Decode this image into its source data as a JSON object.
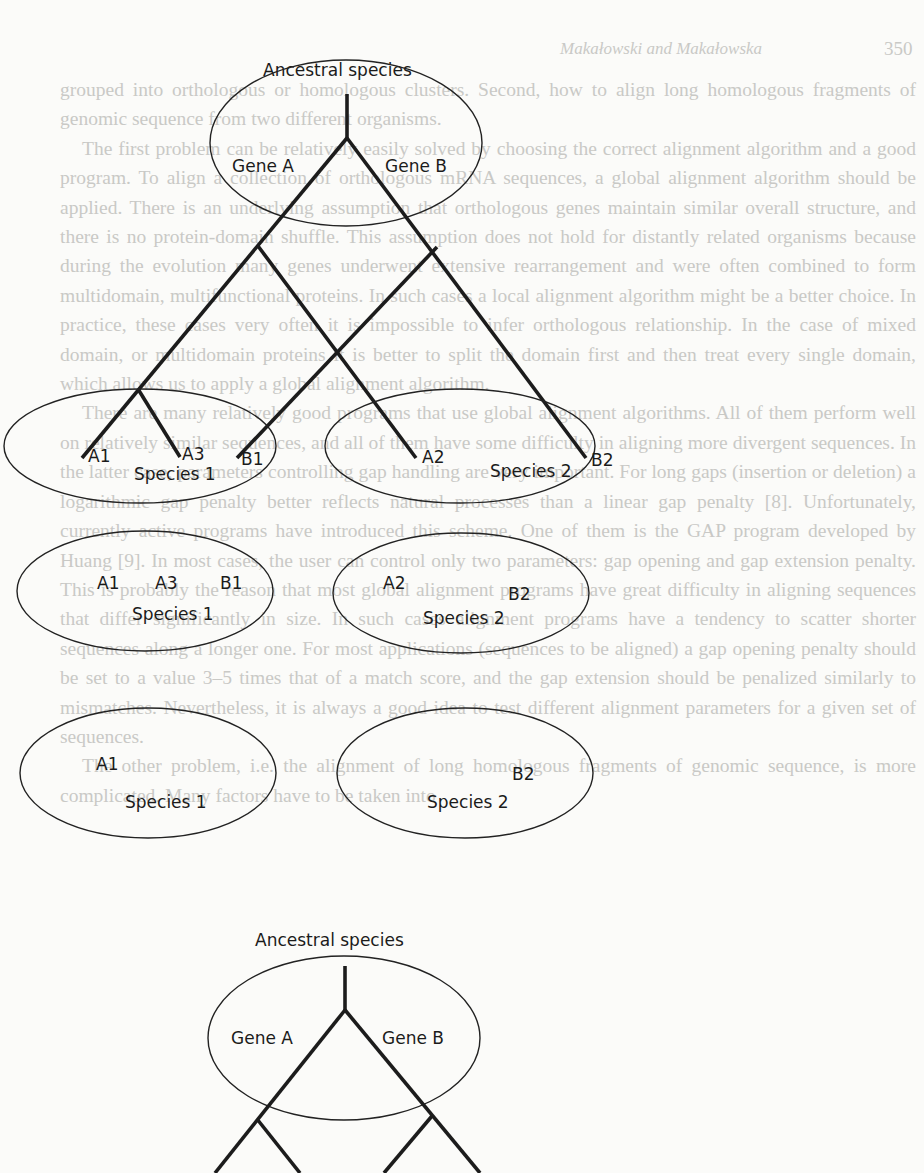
{
  "page": {
    "page_number": "350",
    "running_header": "Makałowski and Makałowska",
    "bleed_through_text": [
      "grouped into orthologous or homologous clusters. Second, how to align long homologous fragments of genomic sequence from two different organisms.",
      "The first problem can be relatively easily solved by choosing the correct alignment algorithm and a good program. To align a collection of orthologous mRNA sequences, a global alignment algorithm should be applied. There is an underlying assumption that orthologous genes maintain similar overall structure, and there is no protein-domain shuffle. This assumption does not hold for distantly related organisms because during the evolution many genes underwent extensive rearrangement and were often combined to form multidomain, multifunctional proteins. In such cases a local alignment algorithm might be a better choice. In practice, these cases very often it is impossible to infer orthologous relationship. In the case of mixed domain, or multidomain proteins it is better to split the domain first and then treat every single domain, which allows us to apply a global alignment algorithm.",
      "There are many relatively good programs that use global alignment algorithms. All of them perform well on relatively similar sequences, and all of them have some difficulty in aligning more divergent sequences. In the latter case, parameters controlling gap handling are very important. For long gaps (insertion or deletion) a logarithmic gap penalty better reflects natural processes than a linear gap penalty [8]. Unfortunately, currently active programs have introduced this scheme. One of them is the GAP program developed by Huang [9]. In most cases, the user can control only two parameters: gap opening and gap extension penalty. This is probably the reason that most global alignment programs have great difficulty in aligning sequences that differ significantly in size. In such cases alignment programs have a tendency to scatter shorter sequences along a longer one. For most applications (sequences to be aligned) a gap opening penalty should be set to a value 3–5 times that of a match score, and the gap extension should be penalized similarly to mismatches. Nevertheless, it is always a good idea to test different alignment parameters for a given set of sequences.",
      "The other problem, i.e. the alignment of long homologous fragments of genomic sequence, is more complicated. Many factors have to be taken into"
    ]
  },
  "diagram": {
    "panels": [
      {
        "id": "top-tree",
        "ancestor_label": "Ancestral species",
        "gene_labels": [
          "Gene A",
          "Gene B"
        ],
        "species": [
          {
            "label": "Species 1",
            "genes": [
              "A1",
              "A3",
              "B1"
            ]
          },
          {
            "label": "Species 2",
            "genes": [
              "A2",
              "B2"
            ]
          }
        ]
      },
      {
        "id": "middle-sets",
        "species": [
          {
            "label": "Species 1",
            "genes": [
              "A1",
              "A3",
              "B1"
            ]
          },
          {
            "label": "Species 2",
            "genes": [
              "A2",
              "B2"
            ]
          }
        ]
      },
      {
        "id": "reduced-sets",
        "species": [
          {
            "label": "Species 1",
            "genes": [
              "A1"
            ]
          },
          {
            "label": "Species 2",
            "genes": [
              "B2"
            ]
          }
        ]
      },
      {
        "id": "bottom-tree",
        "ancestor_label": "Ancestral species",
        "gene_labels": [
          "Gene A",
          "Gene B"
        ]
      }
    ]
  },
  "colors": {
    "ink": "#1c1c1c",
    "paper": "#fbfbf9",
    "bleed_text": "#c9c9c6"
  }
}
